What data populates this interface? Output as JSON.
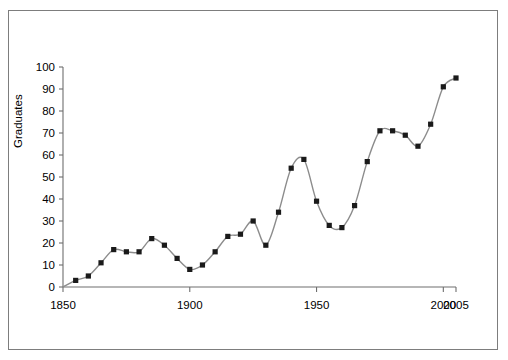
{
  "figure": {
    "background_color": "#ffffff",
    "border_color": "#7d7d7d",
    "line_color": "#8c8c8c",
    "marker_color": "#1a1a1a",
    "axis_color": "#6e6e6e"
  },
  "axes": {
    "ylabel": "Graduates",
    "xlabel": "",
    "ytick_labels": [
      "0",
      "10",
      "20",
      "30",
      "40",
      "50",
      "60",
      "70",
      "80",
      "90",
      "100"
    ],
    "xtick_labels": [
      "1850",
      "1900",
      "1950",
      "2000",
      "2005"
    ]
  },
  "chart_data": {
    "type": "line",
    "title": "",
    "xlabel": "",
    "ylabel": "Graduates",
    "xlim": [
      1850,
      2005
    ],
    "ylim": [
      0,
      100
    ],
    "xticks": [
      1850,
      1900,
      1950,
      2000,
      2005
    ],
    "yticks": [
      0,
      10,
      20,
      30,
      40,
      50,
      60,
      70,
      80,
      90,
      100
    ],
    "grid": false,
    "legend": null,
    "markers": "square",
    "x": [
      1855,
      1860,
      1865,
      1870,
      1875,
      1880,
      1885,
      1890,
      1895,
      1900,
      1905,
      1910,
      1915,
      1920,
      1925,
      1930,
      1935,
      1940,
      1945,
      1950,
      1955,
      1960,
      1965,
      1970,
      1975,
      1980,
      1985,
      1990,
      1995,
      2000,
      2005
    ],
    "values": [
      3,
      5,
      11,
      17,
      16,
      16,
      22,
      19,
      13,
      8,
      10,
      16,
      23,
      24,
      30,
      19,
      34,
      54,
      58,
      39,
      28,
      27,
      37,
      57,
      71,
      71,
      69,
      64,
      74,
      91,
      95
    ],
    "series": [
      {
        "name": "Graduates",
        "values": [
          3,
          5,
          11,
          17,
          16,
          16,
          22,
          19,
          13,
          8,
          10,
          16,
          23,
          24,
          30,
          19,
          34,
          54,
          58,
          39,
          28,
          27,
          37,
          57,
          71,
          71,
          69,
          64,
          74,
          91,
          95
        ]
      }
    ]
  }
}
